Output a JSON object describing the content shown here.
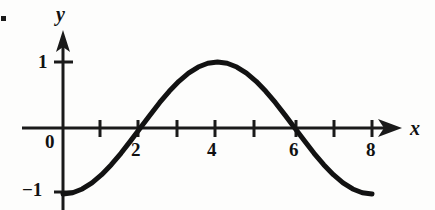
{
  "figure": {
    "item_marker": "•",
    "axis_labels": {
      "x": "x",
      "y": "y"
    },
    "origin_label": "0",
    "y_tick_labels": [
      "1",
      "−1"
    ],
    "x_tick_labels": [
      "2",
      "4",
      "6",
      "8"
    ],
    "curve_color": "#121212",
    "axis_color": "#1a1a1a",
    "background_color": "#fdfdfc"
  },
  "chart_data": {
    "type": "line",
    "title": "",
    "xlabel": "x",
    "ylabel": "y",
    "xlim": [
      0,
      8.6
    ],
    "ylim": [
      -1.25,
      1.35
    ],
    "grid": false,
    "legend": null,
    "function": "y = -cos(pi*x/4)",
    "x_ticks": [
      1,
      2,
      3,
      4,
      5,
      6,
      7,
      8
    ],
    "x_tick_labels_shown": [
      "2",
      "4",
      "6",
      "8"
    ],
    "y_ticks": [
      -1,
      1
    ],
    "y_tick_labels_shown": [
      "1",
      "−1"
    ],
    "x_zero_crossings": [
      2,
      6
    ],
    "maximum": {
      "x": 4,
      "y": 1
    },
    "minima": [
      {
        "x": 0,
        "y": -1
      },
      {
        "x": 8,
        "y": -1
      }
    ],
    "x": [
      0,
      0.25,
      0.5,
      0.75,
      1,
      1.25,
      1.5,
      1.75,
      2,
      2.25,
      2.5,
      2.75,
      3,
      3.25,
      3.5,
      3.75,
      4,
      4.25,
      4.5,
      4.75,
      5,
      5.25,
      5.5,
      5.75,
      6,
      6.25,
      6.5,
      6.75,
      7,
      7.25,
      7.5,
      7.75,
      8
    ],
    "values": [
      -1,
      -0.981,
      -0.924,
      -0.831,
      -0.707,
      -0.556,
      -0.383,
      -0.195,
      0,
      0.195,
      0.383,
      0.556,
      0.707,
      0.831,
      0.924,
      0.981,
      1,
      0.981,
      0.924,
      0.831,
      0.707,
      0.556,
      0.383,
      0.195,
      0,
      -0.195,
      -0.383,
      -0.556,
      -0.707,
      -0.831,
      -0.924,
      -0.981,
      -1
    ]
  }
}
